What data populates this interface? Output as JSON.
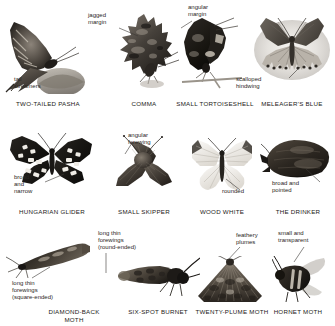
{
  "page": {
    "background_color": "#ffffff",
    "text_color": "#1c1a18",
    "annotation_color": "#2a2724",
    "leader_color": "#3a3734"
  },
  "specimens": [
    {
      "id": "two-tailed-pasha",
      "caption": "TWO-TAILED PASHA",
      "annotations": [
        {
          "id": "tail-streamers",
          "text": "tail\nstreamers"
        }
      ]
    },
    {
      "id": "comma",
      "caption": "COMMA",
      "annotations": [
        {
          "id": "jagged-margin",
          "text": "jagged\nmargin"
        }
      ]
    },
    {
      "id": "small-tortoiseshell",
      "caption": "SMALL TORTOISESHELL",
      "annotations": [
        {
          "id": "angular-margin",
          "text": "angular\nmargin"
        }
      ]
    },
    {
      "id": "meleagers-blue",
      "caption": "MELEAGER'S BLUE",
      "annotations": [
        {
          "id": "scalloped-hindwing",
          "text": "scalloped\nhindwing"
        }
      ]
    },
    {
      "id": "hungarian-glider",
      "caption": "HUNGARIAN GLIDER",
      "annotations": [
        {
          "id": "broad-and-narrow",
          "text": "broad\nand\nnarrow"
        }
      ]
    },
    {
      "id": "small-skipper",
      "caption": "SMALL SKIPPER",
      "annotations": [
        {
          "id": "angular-forewing",
          "text": "angular\nforewing"
        }
      ]
    },
    {
      "id": "wood-white",
      "caption": "WOOD WHITE",
      "annotations": [
        {
          "id": "rounded",
          "text": "rounded"
        }
      ]
    },
    {
      "id": "the-drinker",
      "caption": "THE DRINKER",
      "annotations": [
        {
          "id": "broad-and-pointed",
          "text": "broad and\npointed"
        }
      ]
    },
    {
      "id": "diamond-back-moth",
      "caption": "DIAMOND-BACK\nMOTH",
      "annotations": [
        {
          "id": "long-thin-forewings-square",
          "text": "long thin\nforewings\n(square-ended)"
        }
      ]
    },
    {
      "id": "six-spot-burnet",
      "caption": "SIX-SPOT BURNET",
      "annotations": [
        {
          "id": "long-thin-forewings-round",
          "text": "long thin\nforewings\n(round-ended)"
        }
      ]
    },
    {
      "id": "twenty-plume-moth",
      "caption": "TWENTY-PLUME MOTH",
      "annotations": [
        {
          "id": "feathery-plumes",
          "text": "feathery\nplumes"
        }
      ]
    },
    {
      "id": "hornet-moth",
      "caption": "HORNET MOTH",
      "annotations": [
        {
          "id": "small-and-transparent",
          "text": "small and\ntransparent"
        }
      ]
    }
  ]
}
